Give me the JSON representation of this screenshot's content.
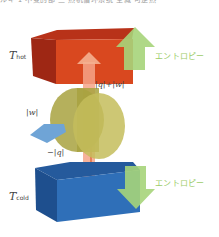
{
  "header": {
    "cut_text": "ルギ 1 不变的部 二 热机循环系统 全减 可逆热"
  },
  "labels": {
    "t_hot_main": "T",
    "t_hot_sub": "hot",
    "t_cold_main": "T",
    "t_cold_sub": "cold",
    "q_plus_w": "|q|+|w|",
    "w": "|w|",
    "minus_q": "−|q|",
    "entropy_top": "エントロピー",
    "entropy_bottom": "エントロピー"
  },
  "colors": {
    "hot_front": "#d9481f",
    "hot_side": "#9e2714",
    "hot_top": "#b83219",
    "cold_front": "#2f6fb8",
    "cold_side": "#1e4f8e",
    "cold_top": "#255a9c",
    "arrow_green": "#a6d47a",
    "heat_flow": "#f4a488",
    "engine": "#b9b250",
    "work_plate": "#6fa4d6",
    "entropy_text": "#9dcc6a"
  }
}
